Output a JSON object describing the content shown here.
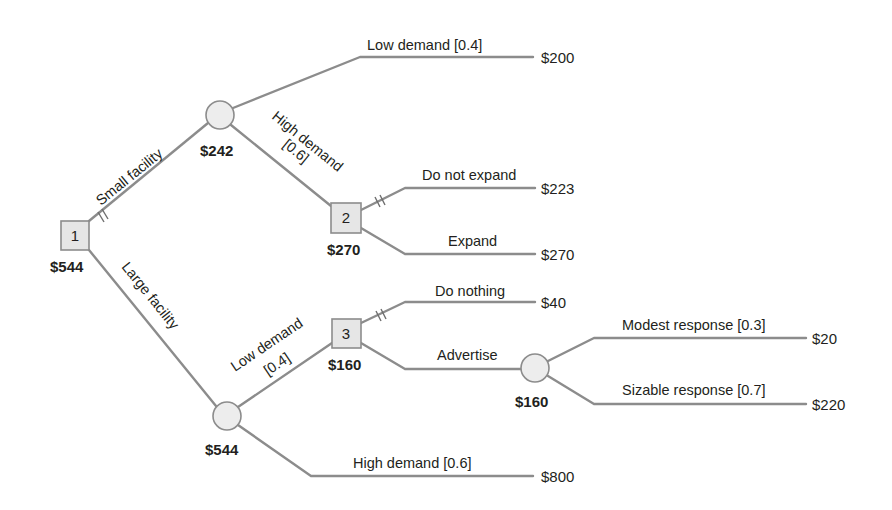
{
  "diagram": {
    "type": "decision-tree",
    "nodes": {
      "decision_1": {
        "id": "1",
        "value": "$544"
      },
      "chance_small": {
        "value": "$242"
      },
      "decision_2": {
        "id": "2",
        "value": "$270"
      },
      "chance_large": {
        "value": "$544"
      },
      "decision_3": {
        "id": "3",
        "value": "$160"
      },
      "chance_advertise": {
        "value": "$160"
      }
    },
    "branches": {
      "small_facility": "Small facility",
      "large_facility": "Large facility",
      "small_low_demand": "Low demand [0.4]",
      "small_high_demand_line1": "High demand",
      "small_high_demand_line2": "[0.6]",
      "do_not_expand": "Do not expand",
      "expand": "Expand",
      "large_low_demand_line1": "Low demand",
      "large_low_demand_line2": "[0.4]",
      "large_high_demand": "High demand [0.6]",
      "do_nothing": "Do nothing",
      "advertise": "Advertise",
      "modest_response": "Modest response [0.3]",
      "sizable_response": "Sizable response [0.7]"
    },
    "payoffs": {
      "small_low": "$200",
      "do_not_expand": "$223",
      "expand": "$270",
      "do_nothing": "$40",
      "modest": "$20",
      "sizable": "$220",
      "large_high": "$800"
    },
    "colors": {
      "edge": "#8c8c8c",
      "node_fill": "#e6e6e6",
      "text": "#231f20"
    }
  }
}
